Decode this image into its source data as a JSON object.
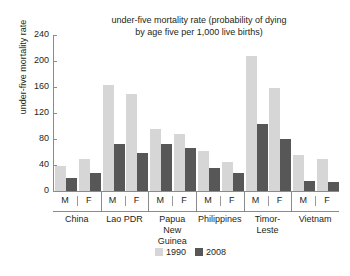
{
  "chart_data": {
    "type": "bar",
    "title": "under-five mortality rate (probability of dying by age five per 1,000 live births)",
    "title_line1": "under-five mortality rate (probability of dying",
    "title_line2": "by age five per 1,000 live births)",
    "xlabel": "",
    "ylabel": "under-five mortality rate",
    "ylim": [
      0,
      240
    ],
    "yticks": [
      0,
      40,
      80,
      120,
      160,
      200,
      240
    ],
    "ytick_labels": [
      "0",
      "40",
      "80",
      "120",
      "160",
      "200",
      "240"
    ],
    "grid": false,
    "legend_position": "bottom-right",
    "categories": [
      "China M",
      "China F",
      "Lao PDR M",
      "Lao PDR F",
      "Papua New Guinea M",
      "Papua New Guinea F",
      "Philippines M",
      "Philippines F",
      "Timor-Leste M",
      "Timor-Leste F",
      "Vietnam M",
      "Vietnam F"
    ],
    "groups": [
      {
        "country": "China",
        "country_line1": "China",
        "country_line2": "",
        "sexes": [
          "M",
          "F"
        ]
      },
      {
        "country": "Lao PDR",
        "country_line1": "Lao PDR",
        "country_line2": "",
        "sexes": [
          "M",
          "F"
        ]
      },
      {
        "country": "Papua New Guinea",
        "country_line1": "Papua",
        "country_line2": "New Guinea",
        "sexes": [
          "M",
          "F"
        ]
      },
      {
        "country": "Philippines",
        "country_line1": "Philippines",
        "country_line2": "",
        "sexes": [
          "M",
          "F"
        ]
      },
      {
        "country": "Timor-Leste",
        "country_line1": "Timor-",
        "country_line2": "Leste",
        "sexes": [
          "M",
          "F"
        ]
      },
      {
        "country": "Vietnam",
        "country_line1": "Vietnam",
        "country_line2": "",
        "sexes": [
          "M",
          "F"
        ]
      }
    ],
    "series": [
      {
        "name": "1990",
        "color": "#d6d6d6",
        "values": [
          38,
          50,
          163,
          150,
          95,
          87,
          62,
          45,
          208,
          158,
          55,
          50
        ]
      },
      {
        "name": "2008",
        "color": "#575757",
        "values": [
          20,
          27,
          72,
          58,
          73,
          66,
          35,
          27,
          103,
          80,
          16,
          14
        ]
      }
    ]
  },
  "legend": {
    "items": [
      {
        "label": "1990",
        "color": "#d6d6d6"
      },
      {
        "label": "2008",
        "color": "#575757"
      }
    ]
  },
  "colors": {
    "series_1990": "#d6d6d6",
    "series_2008": "#575757",
    "axis": "#8b8b8b",
    "text": "#231f20",
    "background": "#ffffff"
  }
}
